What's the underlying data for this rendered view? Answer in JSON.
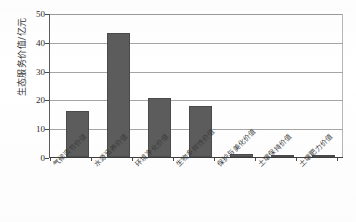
{
  "chart_data": {
    "type": "bar",
    "title": "",
    "xlabel": "",
    "ylabel": "生态服务价值/亿元",
    "ylim": [
      0,
      50
    ],
    "yticks": [
      0,
      10,
      20,
      30,
      40,
      50
    ],
    "ytick_labels": [
      "0",
      "10",
      "20",
      "30",
      "40",
      "50"
    ],
    "grid": true,
    "legend": "none",
    "bar_color": "#5c5c5c",
    "categories": [
      "气候调节价值",
      "水源涵养价值",
      "环境净化价值",
      "生物多样性价值",
      "保护与美化价值",
      "土壤保持价值",
      "土壤肥力价值"
    ],
    "values": [
      16.0,
      43.5,
      20.5,
      18.0,
      1.0,
      0.3,
      0.3
    ]
  },
  "axis": {
    "y_title": "生态服务价值/亿元"
  }
}
